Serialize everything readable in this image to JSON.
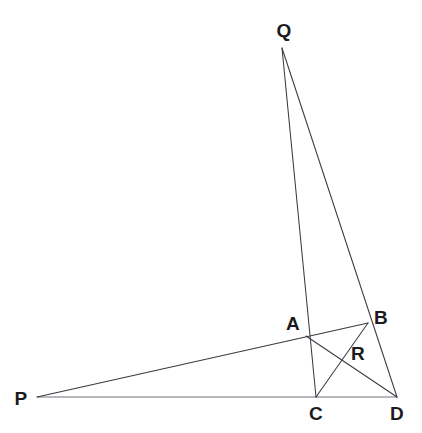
{
  "figure": {
    "canvas": {
      "width": 422,
      "height": 433
    },
    "background_color": "#ffffff",
    "line_color": "#3a3a42",
    "baseline_color": "#6f6f78",
    "label_color": "#1b1b1f"
  },
  "points": [
    {
      "id": "P",
      "label": "P",
      "x": 37,
      "y": 397,
      "label_x": 21,
      "label_y": 398
    },
    {
      "id": "Q",
      "label": "Q",
      "x": 282,
      "y": 48,
      "label_x": 284,
      "label_y": 30
    },
    {
      "id": "A",
      "label": "A",
      "x": 306,
      "y": 336,
      "label_x": 293,
      "label_y": 323
    },
    {
      "id": "B",
      "label": "B",
      "x": 368,
      "y": 323,
      "label_x": 381,
      "label_y": 317
    },
    {
      "id": "C",
      "label": "C",
      "x": 316,
      "y": 397,
      "label_x": 316,
      "label_y": 413
    },
    {
      "id": "D",
      "label": "D",
      "x": 397,
      "y": 397,
      "label_x": 397,
      "label_y": 413
    },
    {
      "id": "R",
      "label": "R",
      "x": 340,
      "y": 354,
      "label_x": 358,
      "label_y": 353
    }
  ],
  "segments": [
    {
      "id": "PD",
      "from": "P",
      "to": "D",
      "style": "baseline"
    },
    {
      "id": "PB",
      "from": "P",
      "to": "B",
      "style": "edge"
    },
    {
      "id": "QC",
      "from": "Q",
      "to": "C",
      "style": "edge"
    },
    {
      "id": "QD",
      "from": "Q",
      "to": "D",
      "style": "edge"
    },
    {
      "id": "AD",
      "from": "A",
      "to": "D",
      "style": "edge"
    },
    {
      "id": "CB",
      "from": "C",
      "to": "B",
      "style": "edge"
    }
  ]
}
